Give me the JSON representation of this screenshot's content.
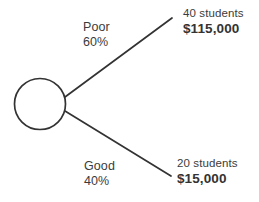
{
  "diagram": {
    "type": "decision-tree",
    "title": "",
    "node": {
      "shape": "circle",
      "label": ""
    },
    "branches": [
      {
        "name": "poor-branch",
        "label": "Poor",
        "probability": "60%",
        "outcome_count": "40 students",
        "outcome_value": "$115,000"
      },
      {
        "name": "good-branch",
        "label": "Good",
        "probability": "40%",
        "outcome_count": "20 students",
        "outcome_value": "$15,000"
      }
    ],
    "colors": {
      "stroke": "#333333",
      "text": "#3b3b3b",
      "background": "#ffffff"
    }
  }
}
